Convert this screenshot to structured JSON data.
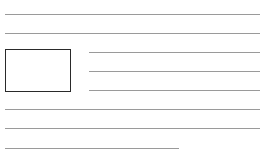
{
  "wireframe": {
    "description": "Text-wrap layout sketch: image placeholder with text lines",
    "colors": {
      "line": "#8a8a8a",
      "box_border": "#2a2a2a",
      "background": "#ffffff"
    },
    "image_placeholder": {
      "x": 5,
      "y": 49,
      "w": 66,
      "h": 43
    },
    "lines": [
      {
        "id": "full-1",
        "x": 5,
        "y": 14,
        "w": 255
      },
      {
        "id": "full-2",
        "x": 5,
        "y": 33,
        "w": 255
      },
      {
        "id": "wrap-1",
        "x": 89,
        "y": 52,
        "w": 171
      },
      {
        "id": "wrap-2",
        "x": 89,
        "y": 71,
        "w": 171
      },
      {
        "id": "wrap-3",
        "x": 89,
        "y": 90,
        "w": 171
      },
      {
        "id": "full-3",
        "x": 5,
        "y": 109,
        "w": 255
      },
      {
        "id": "full-4",
        "x": 5,
        "y": 128,
        "w": 255
      },
      {
        "id": "short-last",
        "x": 5,
        "y": 148,
        "w": 174
      }
    ]
  }
}
